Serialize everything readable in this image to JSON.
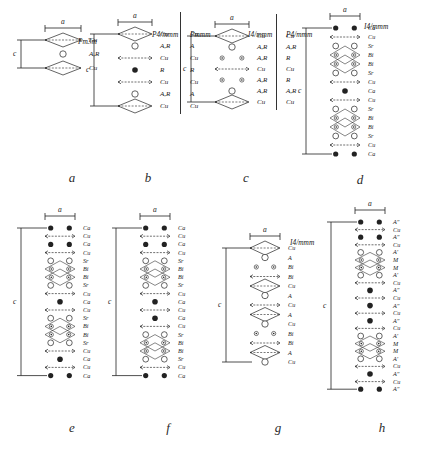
{
  "figure": {
    "dim_a": "a",
    "dim_c": "c",
    "ink": "#222222"
  },
  "panels": [
    {
      "id": "a",
      "caption": "a",
      "space_groups": [
        "Pm3m"
      ],
      "layers": [
        {
          "label": "Cu",
          "type": "open-small"
        },
        {
          "label": "A,R",
          "type": "open-large"
        },
        {
          "label": "Cu",
          "type": "open-small"
        }
      ]
    },
    {
      "id": "b",
      "caption": "b",
      "space_groups": [
        "P4/mmm",
        "Pmmm"
      ],
      "labels_col1": [
        "Cu",
        "A,R",
        "Cu",
        "R",
        "Cu",
        "A,R",
        "Cu"
      ],
      "labels_col2": [
        "Cu",
        "A",
        "Cu",
        "R",
        "Cu",
        "A",
        "Cu"
      ]
    },
    {
      "id": "c",
      "caption": "c",
      "space_groups": [
        "I4/mmm",
        "P4/mmm"
      ],
      "labels_col1": [
        "Cu",
        "A,R",
        "A,R",
        "Cu",
        "A,R",
        "A,R",
        "Cu"
      ],
      "labels_col2": [
        "Cu",
        "A,R",
        "R",
        "Cu",
        "R",
        "A,R",
        "Cu"
      ]
    },
    {
      "id": "d",
      "caption": "d",
      "space_groups": [
        "I4/mmm"
      ],
      "labels_col1": [
        "Ca",
        "Cu",
        "Sr",
        "Bi",
        "Bi",
        "Sr",
        "Cu",
        "Ca",
        "Cu",
        "Sr",
        "Bi",
        "Bi",
        "Sr",
        "Cu",
        "Ca"
      ]
    },
    {
      "id": "e",
      "caption": "e",
      "space_groups": [],
      "labels_col1": [
        "Ca",
        "Cu",
        "Ca",
        "Cu",
        "Sr",
        "Bi",
        "Bi",
        "Sr",
        "Cu",
        "Ca",
        "Cu",
        "Sr",
        "Bi",
        "Bi",
        "Sr",
        "Cu",
        "Ca",
        "Cu",
        "Ca"
      ]
    },
    {
      "id": "f",
      "caption": "f",
      "space_groups": [],
      "labels_col1": [
        "Ca",
        "Cu",
        "Ca",
        "Cu",
        "Sr",
        "Bi",
        "Bi",
        "Sr",
        "Cu",
        "Ca",
        "Cu",
        "Ca",
        "Cu",
        "Sr",
        "Bi",
        "Bi",
        "Sr",
        "Cu",
        "Ca"
      ]
    },
    {
      "id": "g",
      "caption": "g",
      "space_groups": [
        "I4/mmm"
      ],
      "labels_col1": [
        "Cu",
        "A",
        "Bi",
        "Bi",
        "Cu",
        "A",
        "Cu",
        "A",
        "Cu",
        "Bi",
        "Bi",
        "A",
        "Cu"
      ]
    },
    {
      "id": "h",
      "caption": "h",
      "space_groups": [],
      "labels_col1": [
        "A″",
        "Cu",
        "A″",
        "Cu",
        "A′",
        "M",
        "M",
        "A′",
        "Cu",
        "A″",
        "Cu",
        "A″",
        "Cu",
        "A″",
        "Cu",
        "A′",
        "M",
        "M",
        "A′",
        "Cu",
        "A″",
        "Cu",
        "A″"
      ]
    }
  ]
}
